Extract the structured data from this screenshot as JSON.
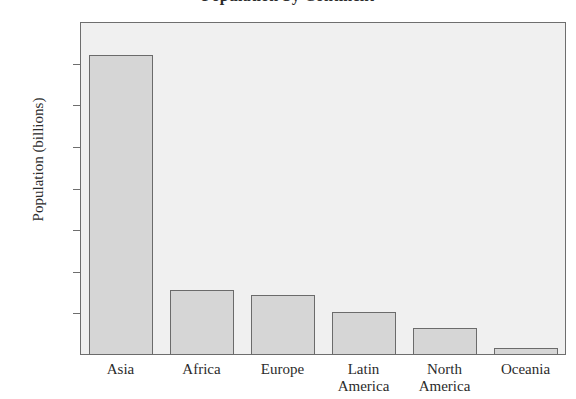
{
  "chart_data": {
    "type": "bar",
    "title": "Population by Continent",
    "xlabel": "",
    "ylabel": "Population (billions)",
    "categories": [
      "Asia",
      "Africa",
      "Europe",
      "Latin\nAmerica",
      "North\nAmerica",
      "Oceania"
    ],
    "values": [
      3.6,
      0.78,
      0.72,
      0.52,
      0.32,
      0.08
    ],
    "ylim": [
      0,
      4.0
    ],
    "ytick_labels": [
      "4.0",
      "3.5",
      "3.0",
      "2.5",
      "2.0",
      "1.5",
      "1.0",
      "0.5",
      "0"
    ],
    "ytick_values": [
      4.0,
      3.5,
      3.0,
      2.5,
      2.0,
      1.5,
      1.0,
      0.5,
      0
    ],
    "grid": false,
    "legend": null,
    "bar_fill_color": "#d6d6d6",
    "bar_edge_color": "#6b6b6b",
    "plot_background_color": "#f0f0f0",
    "axis_color": "#6e6e6e"
  }
}
